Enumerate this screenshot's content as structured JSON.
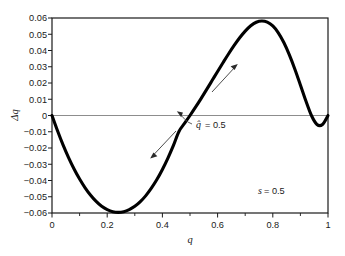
{
  "chart_data": {
    "type": "line",
    "title": "",
    "subtitle": "",
    "xlabel": "q",
    "ylabel": "Δq",
    "xlim": [
      0,
      1
    ],
    "ylim": [
      -0.06,
      0.06
    ],
    "grid": false,
    "legend": "none",
    "x_ticks": [
      "0",
      "0.2",
      "0.4",
      "0.6",
      "0.8",
      "1"
    ],
    "x_tick_values": [
      0,
      0.2,
      0.4,
      0.6,
      0.8,
      1
    ],
    "x_minor_tick_values": [
      0.1,
      0.3,
      0.5,
      0.7,
      0.9
    ],
    "y_ticks": [
      "0.06",
      "0.05",
      "0.04",
      "0.03",
      "0.02",
      "0.01",
      "0",
      "−0.01",
      "−0.02",
      "−0.03",
      "−0.04",
      "−0.05",
      "−0.06"
    ],
    "y_tick_values": [
      0.06,
      0.05,
      0.04,
      0.03,
      0.02,
      0.01,
      0,
      -0.01,
      -0.02,
      -0.03,
      -0.04,
      -0.05,
      -0.06
    ],
    "zero_line": 0,
    "series": [
      {
        "name": "Δq",
        "x": [
          0.0,
          0.02,
          0.04,
          0.06,
          0.08,
          0.1,
          0.12,
          0.14,
          0.16,
          0.18,
          0.2,
          0.22,
          0.24,
          0.26,
          0.28,
          0.3,
          0.32,
          0.34,
          0.36,
          0.38,
          0.4,
          0.42,
          0.44,
          0.46,
          0.48,
          0.5,
          0.52,
          0.54,
          0.56,
          0.58,
          0.6,
          0.62,
          0.64,
          0.66,
          0.68,
          0.7,
          0.72,
          0.74,
          0.76,
          0.78,
          0.8,
          0.82,
          0.84,
          0.86,
          0.88,
          0.9,
          0.92,
          0.94,
          0.96,
          0.98,
          1.0
        ],
        "y": [
          0.0,
          -0.0094,
          -0.0181,
          -0.0259,
          -0.0329,
          -0.0391,
          -0.0445,
          -0.0491,
          -0.0529,
          -0.0559,
          -0.0579,
          -0.0592,
          -0.0596,
          -0.0592,
          -0.0579,
          -0.0559,
          -0.053,
          -0.0493,
          -0.0447,
          -0.0394,
          -0.0332,
          -0.0262,
          -0.0184,
          -0.0098,
          -0.0049,
          0.0,
          0.0051,
          0.0104,
          0.0159,
          0.0215,
          0.0271,
          0.0326,
          0.038,
          0.0431,
          0.0478,
          0.0519,
          0.0552,
          0.0574,
          0.0582,
          0.0575,
          0.0551,
          0.0509,
          0.0449,
          0.0373,
          0.0285,
          0.0188,
          0.0089,
          0.0,
          -0.0055,
          -0.0055,
          0.0
        ]
      }
    ],
    "annotations": [
      {
        "name": "equilibrium-label",
        "text": "q̂ = 0.5",
        "italic_symbol": "q̂",
        "value": "0.5",
        "x": 0.5,
        "y": 0.0
      },
      {
        "name": "selection-parameter-label",
        "text": "s = 0.5",
        "italic_symbol": "s",
        "value": "0.5",
        "x": 0.78,
        "y": -0.047
      },
      {
        "name": "up-arrow-annotation",
        "text": "",
        "direction": "up-right",
        "from_x": 0.58,
        "from_y": 0.014,
        "to_x": 0.665,
        "to_y": 0.0405
      },
      {
        "name": "down-arrow-annotation",
        "text": "",
        "direction": "down-left",
        "from_x": 0.45,
        "from_y": -0.0095,
        "to_x": 0.365,
        "to_y": -0.0345
      }
    ],
    "colors": {
      "curve": "#000000",
      "frame": "#1a1a1a",
      "zero_line": "#808080",
      "background": "#ffffff",
      "annotation": "#4d4d4d"
    }
  }
}
